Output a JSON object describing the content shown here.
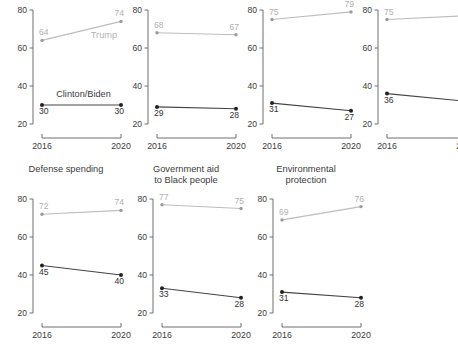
{
  "figure": {
    "caption": "Figure 2",
    "y_axis": {
      "ticks": [
        20,
        40,
        60,
        80
      ],
      "min": 20,
      "max": 80
    },
    "x_axis": {
      "ticks": [
        "2016",
        "2020"
      ]
    },
    "series_colors": {
      "trump": "#bdbdbd",
      "clinton_biden": "#444444"
    },
    "series_names": {
      "gray": "Trump",
      "dark": "Clinton/Biden"
    }
  },
  "chart_data": {
    "type": "line",
    "title": "",
    "xlabel": "",
    "ylabel": "",
    "x": [
      "2016",
      "2020"
    ],
    "ylim": [
      20,
      80
    ],
    "yticks": [
      20,
      40,
      60,
      80
    ],
    "grid": false,
    "legend": "inline",
    "panels": [
      {
        "title": "",
        "row": 0,
        "col": 0,
        "inline_labels": {
          "gray": "Trump",
          "dark": "Clinton/Biden"
        },
        "series": [
          {
            "name": "Trump",
            "color": "#bdbdbd",
            "values": [
              64,
              74
            ],
            "labels": [
              "64",
              "74"
            ]
          },
          {
            "name": "Clinton/Biden",
            "color": "#444444",
            "values": [
              30,
              30
            ],
            "labels": [
              "30",
              "30"
            ]
          }
        ]
      },
      {
        "title": "",
        "row": 0,
        "col": 1,
        "series": [
          {
            "name": "Trump",
            "color": "#bdbdbd",
            "values": [
              68,
              67
            ],
            "labels": [
              "68",
              "67"
            ]
          },
          {
            "name": "Clinton/Biden",
            "color": "#444444",
            "values": [
              29,
              28
            ],
            "labels": [
              "29",
              "28"
            ]
          }
        ]
      },
      {
        "title": "",
        "row": 0,
        "col": 2,
        "series": [
          {
            "name": "Trump",
            "color": "#bdbdbd",
            "values": [
              75,
              79
            ],
            "labels": [
              "75",
              "79"
            ]
          },
          {
            "name": "Clinton/Biden",
            "color": "#444444",
            "values": [
              31,
              27
            ],
            "labels": [
              "31",
              "27"
            ]
          }
        ]
      },
      {
        "title": "",
        "row": 0,
        "col": 3,
        "series": [
          {
            "name": "Trump",
            "color": "#bdbdbd",
            "values": [
              75,
              77
            ],
            "labels": [
              "75",
              "77"
            ]
          },
          {
            "name": "Clinton/Biden",
            "color": "#444444",
            "values": [
              36,
              32
            ],
            "labels": [
              "36",
              "32"
            ]
          }
        ]
      },
      {
        "title": "Defense spending",
        "row": 1,
        "col": 0,
        "series": [
          {
            "name": "Trump",
            "color": "#bdbdbd",
            "values": [
              72,
              74
            ],
            "labels": [
              "72",
              "74"
            ]
          },
          {
            "name": "Clinton/Biden",
            "color": "#444444",
            "values": [
              45,
              40
            ],
            "labels": [
              "45",
              "40"
            ]
          }
        ]
      },
      {
        "title": "Government aid\nto Black people",
        "row": 1,
        "col": 1,
        "series": [
          {
            "name": "Trump",
            "color": "#bdbdbd",
            "values": [
              77,
              75
            ],
            "labels": [
              "77",
              "75"
            ]
          },
          {
            "name": "Clinton/Biden",
            "color": "#444444",
            "values": [
              33,
              28
            ],
            "labels": [
              "33",
              "28"
            ]
          }
        ]
      },
      {
        "title": "Environmental\nprotection",
        "row": 1,
        "col": 2,
        "series": [
          {
            "name": "Trump",
            "color": "#bdbdbd",
            "values": [
              69,
              76
            ],
            "labels": [
              "69",
              "76"
            ]
          },
          {
            "name": "Clinton/Biden",
            "color": "#444444",
            "values": [
              31,
              28
            ],
            "labels": [
              "31",
              "28"
            ]
          }
        ]
      }
    ]
  }
}
